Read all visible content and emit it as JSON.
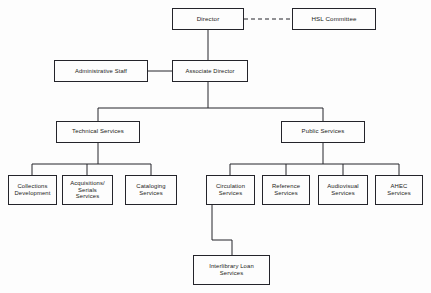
{
  "diagram": {
    "type": "org-chart",
    "line_color": "#24242a",
    "box_fill": "#fdfdfd",
    "background": "#fdfdfd",
    "nodes": [
      {
        "id": "director",
        "label": "Director",
        "level": 1,
        "x": 172,
        "y": 8,
        "w": 72,
        "h": 22
      },
      {
        "id": "hsl-committee",
        "label": "HSL Committee",
        "level": 1,
        "x": 292,
        "y": 8,
        "w": 84,
        "h": 22
      },
      {
        "id": "administrative-staff",
        "label": "Administrative Staff",
        "level": 2,
        "x": 54,
        "y": 60,
        "w": 94,
        "h": 22
      },
      {
        "id": "associate-director",
        "label": "Associate Director",
        "level": 2,
        "x": 172,
        "y": 60,
        "w": 76,
        "h": 22
      },
      {
        "id": "technical-services",
        "label": "Technical Services",
        "level": 3,
        "x": 56,
        "y": 121,
        "w": 84,
        "h": 22
      },
      {
        "id": "public-services",
        "label": "Public Services",
        "level": 3,
        "x": 281,
        "y": 121,
        "w": 84,
        "h": 22
      },
      {
        "id": "collections-development",
        "label": "Collections\nDevelopment",
        "level": 4,
        "x": 8,
        "y": 175,
        "w": 49,
        "h": 30
      },
      {
        "id": "acquisitions-serials-services",
        "label": "Acquisitions/\nSerials\nServices",
        "level": 4,
        "x": 62,
        "y": 175,
        "w": 51,
        "h": 30
      },
      {
        "id": "cataloging-services",
        "label": "Cataloging\nServices",
        "level": 4,
        "x": 125,
        "y": 175,
        "w": 52,
        "h": 30
      },
      {
        "id": "circulation-services",
        "label": "Circulation\nServices",
        "level": 4,
        "x": 206,
        "y": 175,
        "w": 49,
        "h": 30
      },
      {
        "id": "reference-services",
        "label": "Reference\nServices",
        "level": 4,
        "x": 262,
        "y": 175,
        "w": 48,
        "h": 30
      },
      {
        "id": "audiovisual-services",
        "label": "Audiovisual\nServices",
        "level": 4,
        "x": 318,
        "y": 175,
        "w": 50,
        "h": 30
      },
      {
        "id": "ahec-services",
        "label": "AHEC\nServices",
        "level": 4,
        "x": 375,
        "y": 175,
        "w": 48,
        "h": 30
      },
      {
        "id": "interlibrary-loan-services",
        "label": "Interlibrary Loan\nServices",
        "level": 4,
        "x": 193,
        "y": 255,
        "w": 77,
        "h": 30
      }
    ],
    "connectors": [
      {
        "id": "director-to-hsl",
        "style": "dashed",
        "points": "244,19 292,19"
      },
      {
        "id": "director-to-associate",
        "style": "solid",
        "points": "208,30 208,60"
      },
      {
        "id": "admin-to-associate",
        "style": "solid",
        "points": "148,71 172,71"
      },
      {
        "id": "associate-down",
        "style": "solid",
        "points": "208,82 208,108"
      },
      {
        "id": "level3-bus",
        "style": "solid",
        "points": "98,108 323,108"
      },
      {
        "id": "bus-to-technical",
        "style": "solid",
        "points": "98,108 98,121"
      },
      {
        "id": "bus-to-public",
        "style": "solid",
        "points": "323,108 323,121"
      },
      {
        "id": "technical-down",
        "style": "solid",
        "points": "98,143 98,164"
      },
      {
        "id": "technical-bus",
        "style": "solid",
        "points": "32,164 151,164"
      },
      {
        "id": "bus-to-collections",
        "style": "solid",
        "points": "32,164 32,175"
      },
      {
        "id": "bus-to-acquisitions",
        "style": "solid",
        "points": "87,164 87,175"
      },
      {
        "id": "bus-to-cataloging",
        "style": "solid",
        "points": "151,164 151,175"
      },
      {
        "id": "public-down",
        "style": "solid",
        "points": "323,143 323,164"
      },
      {
        "id": "public-bus",
        "style": "solid",
        "points": "230,164 399,164"
      },
      {
        "id": "bus-to-circulation",
        "style": "solid",
        "points": "230,164 230,175"
      },
      {
        "id": "bus-to-reference",
        "style": "solid",
        "points": "286,164 286,175"
      },
      {
        "id": "bus-to-audiovisual",
        "style": "solid",
        "points": "343,164 343,175"
      },
      {
        "id": "bus-to-ahec",
        "style": "solid",
        "points": "399,164 399,175"
      },
      {
        "id": "circulation-to-ill",
        "style": "solid",
        "points": "212,205 212,240 232,240 232,255"
      }
    ]
  }
}
